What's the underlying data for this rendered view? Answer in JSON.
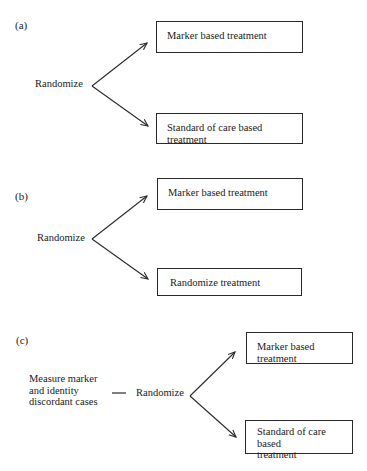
{
  "panels": [
    {
      "label": "(a)",
      "source": "Randomize",
      "arms": [
        {
          "text": "Marker based treatment"
        },
        {
          "text": "Standard of care based treatment"
        }
      ]
    },
    {
      "label": "(b)",
      "source": "Randomize",
      "arms": [
        {
          "text": "Marker based treatment"
        },
        {
          "text": "Randomize treatment"
        }
      ]
    },
    {
      "label": "(c)",
      "pre_step": {
        "lines": [
          "Measure marker",
          "and identity",
          "discordant cases"
        ]
      },
      "connector": "—",
      "source": "Randomize",
      "arms": [
        {
          "text": "Marker based treatment"
        },
        {
          "text_lines": [
            "Standard of care based",
            "treatment"
          ]
        }
      ]
    }
  ],
  "colors": {
    "line": "#2a2a2a",
    "text": "#1a1a1a",
    "background": "#ffffff"
  }
}
